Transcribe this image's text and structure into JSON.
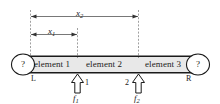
{
  "figure": {
    "beam": {
      "elements": [
        {
          "label": "element 1"
        },
        {
          "label": "element 2"
        },
        {
          "label": "element 3"
        }
      ],
      "ends": {
        "left_label": "L",
        "right_label": "R",
        "left_support_symbol": "?",
        "right_support_symbol": "?"
      },
      "fill_color": "#e8e8e8",
      "line_color": "#1a1a1a"
    },
    "nodes": [
      {
        "label": "1"
      },
      {
        "label": "2"
      }
    ],
    "forces": [
      {
        "label": "f",
        "subscript": "1"
      },
      {
        "label": "f",
        "subscript": "2"
      }
    ],
    "dimensions": [
      {
        "label": "x",
        "subscript": "1"
      },
      {
        "label": "x",
        "subscript": "2"
      }
    ]
  }
}
